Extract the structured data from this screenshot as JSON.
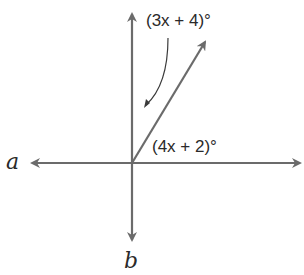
{
  "diagram": {
    "type": "angle-diagram",
    "lines": {
      "a": {
        "label": "a"
      },
      "b": {
        "label": "b"
      }
    },
    "angles": [
      {
        "id": "upper",
        "expression": "(3x + 4)°"
      },
      {
        "id": "lower",
        "expression": "(4x + 2)°"
      }
    ],
    "colors": {
      "line": "#6b6b6b",
      "text": "#2a2a2a"
    }
  }
}
